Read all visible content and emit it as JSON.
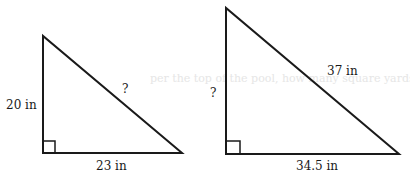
{
  "bleed_through_text": "per the top of the pool, how many square yards would they nee",
  "triangles": [
    {
      "name": "triangle-left",
      "leg_vertical_label": "20 in",
      "leg_horizontal_label": "23 in",
      "hypotenuse_label": "?"
    },
    {
      "name": "triangle-right",
      "leg_vertical_label": "?",
      "leg_horizontal_label": "34.5 in",
      "hypotenuse_label": "37 in"
    }
  ],
  "colors": {
    "stroke": "#1a1a1a",
    "background": "#ffffff"
  }
}
